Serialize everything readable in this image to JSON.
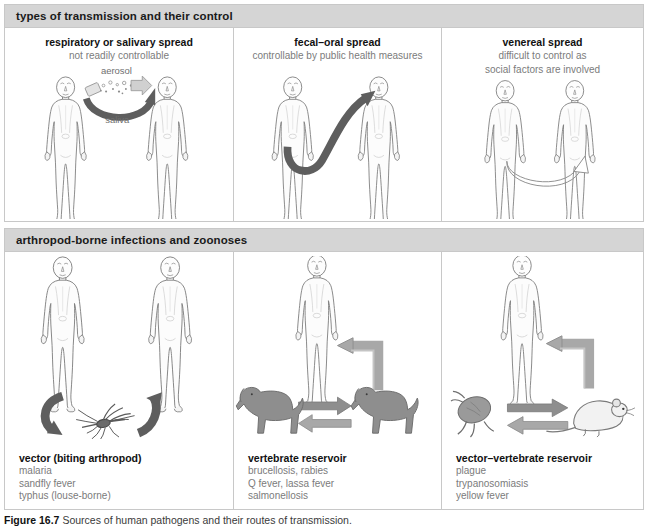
{
  "figure": {
    "caption_label": "Figure 16.7",
    "caption_text": "Sources of human pathogens and their routes of transmission.",
    "colors": {
      "band_bg": "#d5d5d5",
      "border": "#c8c8c8",
      "body_outline": "#6f6f6f",
      "dark_arrow": "#5a5a5a",
      "light_arrow": "#a8a8a8",
      "animal_fill": "#8e8e8e",
      "subtitle_text": "#7b7b7b",
      "title_text": "#111111"
    }
  },
  "sections": [
    {
      "band_title": "types of transmission and their control",
      "panels": [
        {
          "title": "respiratory or salivary spread",
          "subtitle": "not readily controllable",
          "labels": {
            "aerosol": "aerosol",
            "saliva": "saliva"
          }
        },
        {
          "title": "fecal–oral spread",
          "subtitle": "controllable by public health measures",
          "labels": {}
        },
        {
          "title": "venereal spread",
          "subtitle_line1": "difficult to control as",
          "subtitle_line2": "social factors are involved",
          "labels": {}
        }
      ]
    },
    {
      "band_title": "arthropod-borne infections and zoonoses",
      "panels": [
        {
          "caption_head": "vector (biting arthropod)",
          "caption_lines": [
            "malaria",
            "sandfly fever",
            "typhus (louse-borne)"
          ]
        },
        {
          "caption_head": "vertebrate reservoir",
          "caption_lines": [
            "brucellosis, rabies",
            "Q fever, lassa fever",
            "salmonellosis"
          ]
        },
        {
          "caption_head": "vector–vertebrate reservoir",
          "caption_lines": [
            "plague",
            "trypanosomiasis",
            "yellow fever"
          ]
        }
      ]
    }
  ],
  "icons": {
    "human_figure": "human-body-icon",
    "mosquito": "mosquito-icon",
    "dog": "dog-icon",
    "flea": "flea-icon",
    "rat": "rat-icon",
    "arrow": "arrow-icon"
  }
}
